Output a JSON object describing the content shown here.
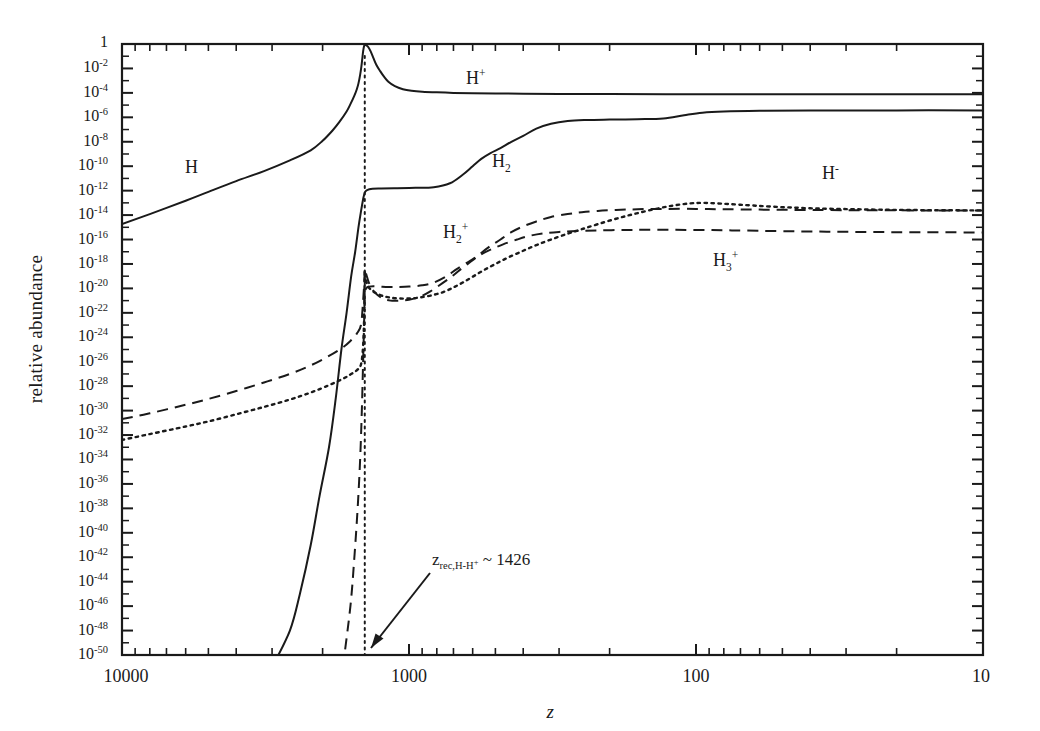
{
  "chart_data": {
    "type": "line",
    "title": "",
    "xlabel": "z",
    "ylabel": "relative abundance",
    "x_scale": "log",
    "y_scale": "log",
    "x_reversed": true,
    "xlim": [
      10000,
      10
    ],
    "ylim": [
      1e-50,
      1
    ],
    "grid": false,
    "legend": "inline-curve-labels",
    "x_tick_labels": [
      "10000",
      "1000",
      "100",
      "10"
    ],
    "x_tick_values": [
      10000,
      1000,
      100,
      10
    ],
    "y_tick_labels": [
      "1",
      "10-2",
      "10-4",
      "10-6",
      "10-8",
      "10-10",
      "10-12",
      "10-14",
      "10-16",
      "10-18",
      "10-20",
      "10-22",
      "10-24",
      "10-26",
      "10-28",
      "10-30",
      "10-32",
      "10-34",
      "10-36",
      "10-38",
      "10-40",
      "10-42",
      "10-44",
      "10-46",
      "10-48",
      "10-50"
    ],
    "y_tick_exponents": [
      0,
      -2,
      -4,
      -6,
      -8,
      -10,
      -12,
      -14,
      -16,
      -18,
      -20,
      -22,
      -24,
      -26,
      -28,
      -30,
      -32,
      -34,
      -36,
      -38,
      -40,
      -42,
      -44,
      -46,
      -48,
      -50
    ],
    "annotations": [
      {
        "name": "recombination-marker",
        "text_main": "z",
        "text_sub": "rec,H-H",
        "text_sup": "+",
        "text_tail": " ~ 1426",
        "z_value": 1426,
        "marker_style": "dotted-vertical-line",
        "arrow": "down-left"
      }
    ],
    "series": [
      {
        "name": "H",
        "label_main": "H",
        "label_sub": "",
        "label_sup": "",
        "style": "solid",
        "points": [
          [
            10000,
            1.8e-15
          ],
          [
            8000,
            1.2e-14
          ],
          [
            6000,
            1.5e-13
          ],
          [
            5000,
            8e-13
          ],
          [
            4000,
            6e-12
          ],
          [
            3200,
            4e-11
          ],
          [
            2600,
            3e-10
          ],
          [
            2200,
            2e-09
          ],
          [
            2000,
            1.2e-08
          ],
          [
            1850,
            8e-08
          ],
          [
            1750,
            4e-07
          ],
          [
            1650,
            3e-06
          ],
          [
            1600,
            1.2e-05
          ],
          [
            1550,
            6e-05
          ],
          [
            1520,
            0.0002
          ],
          [
            1500,
            0.0006
          ],
          [
            1480,
            0.003
          ],
          [
            1465,
            0.015
          ],
          [
            1455,
            0.06
          ],
          [
            1445,
            0.25
          ],
          [
            1435,
            0.62
          ],
          [
            1426,
            0.9
          ],
          [
            1420,
            0.92
          ],
          [
            1410,
            0.93
          ]
        ]
      },
      {
        "name": "H+",
        "label_main": "H",
        "label_sub": "",
        "label_sup": "+",
        "style": "solid",
        "points": [
          [
            1426,
            0.9
          ],
          [
            1390,
            0.6
          ],
          [
            1360,
            0.25
          ],
          [
            1330,
            0.07
          ],
          [
            1300,
            0.02
          ],
          [
            1260,
            0.006
          ],
          [
            1220,
            0.002
          ],
          [
            1180,
            0.0008
          ],
          [
            1120,
            0.00035
          ],
          [
            1050,
            0.0002
          ],
          [
            980,
            0.00015
          ],
          [
            900,
            0.000125
          ],
          [
            800,
            0.00011
          ],
          [
            700,
            0.0001
          ],
          [
            600,
            9.5e-05
          ],
          [
            500,
            9e-05
          ],
          [
            400,
            8.6e-05
          ],
          [
            300,
            8.2e-05
          ],
          [
            200,
            8e-05
          ],
          [
            100,
            7.8e-05
          ],
          [
            50,
            7.7e-05
          ],
          [
            20,
            7.6e-05
          ],
          [
            10,
            7.6e-05
          ]
        ]
      },
      {
        "name": "H2",
        "label_main": "H",
        "label_sub": "2",
        "label_sup": "",
        "style": "solid",
        "points": [
          [
            3000,
            1e-51
          ],
          [
            2600,
            1e-48
          ],
          [
            2400,
            1e-45
          ],
          [
            2200,
            1e-41
          ],
          [
            2050,
            1e-37
          ],
          [
            1900,
            1e-33
          ],
          [
            1800,
            1e-29
          ],
          [
            1720,
            1e-25
          ],
          [
            1650,
            1e-22
          ],
          [
            1590,
            1e-19
          ],
          [
            1540,
            1e-17
          ],
          [
            1500,
            1e-15
          ],
          [
            1470,
            2e-14
          ],
          [
            1445,
            2e-13
          ],
          [
            1426,
            7e-13
          ],
          [
            1400,
            1.1e-12
          ],
          [
            1340,
            1.4e-12
          ],
          [
            1250,
            1.5e-12
          ],
          [
            1100,
            1.6e-12
          ],
          [
            950,
            1.7e-12
          ],
          [
            820,
            1.9e-12
          ],
          [
            720,
            4e-12
          ],
          [
            650,
            2e-11
          ],
          [
            600,
            1e-10
          ],
          [
            560,
            4e-10
          ],
          [
            520,
            1.2e-09
          ],
          [
            480,
            3e-09
          ],
          [
            440,
            1e-08
          ],
          [
            400,
            3e-08
          ],
          [
            360,
            1.2e-07
          ],
          [
            320,
            3e-07
          ],
          [
            280,
            5e-07
          ],
          [
            240,
            6e-07
          ],
          [
            200,
            6.5e-07
          ],
          [
            160,
            7e-07
          ],
          [
            130,
            8e-07
          ],
          [
            110,
            1.5e-06
          ],
          [
            95,
            2.4e-06
          ],
          [
            80,
            3e-06
          ],
          [
            60,
            3.4e-06
          ],
          [
            40,
            3.6e-06
          ],
          [
            20,
            3.7e-06
          ],
          [
            10,
            3.7e-06
          ]
        ]
      },
      {
        "name": "H2+",
        "label_main": "H",
        "label_sub": "2",
        "label_sup": "+",
        "style": "dashed",
        "points": [
          [
            10000,
            2e-31
          ],
          [
            8000,
            6e-31
          ],
          [
            6000,
            3e-30
          ],
          [
            5000,
            9e-30
          ],
          [
            4000,
            4e-29
          ],
          [
            3200,
            2e-28
          ],
          [
            2600,
            1e-27
          ],
          [
            2200,
            5e-27
          ],
          [
            1900,
            3e-26
          ],
          [
            1700,
            1.5e-25
          ],
          [
            1600,
            5e-25
          ],
          [
            1520,
            2e-24
          ],
          [
            1470,
            1e-23
          ],
          [
            1445,
            1e-21
          ],
          [
            1430,
            5e-20
          ],
          [
            1426,
            4e-19
          ],
          [
            1410,
            1.5e-19
          ],
          [
            1380,
            3e-20
          ],
          [
            1340,
            8e-21
          ],
          [
            1290,
            3e-21
          ],
          [
            1230,
            1.4e-21
          ],
          [
            1160,
            1e-21
          ],
          [
            1080,
            1e-21
          ],
          [
            1000,
            1.2e-21
          ],
          [
            920,
            2e-21
          ],
          [
            840,
            6e-21
          ],
          [
            760,
            3e-20
          ],
          [
            700,
            1.2e-19
          ],
          [
            650,
            5e-19
          ],
          [
            600,
            2e-18
          ],
          [
            560,
            8e-18
          ],
          [
            520,
            3e-17
          ],
          [
            480,
            1e-16
          ],
          [
            440,
            4e-16
          ],
          [
            400,
            1.2e-15
          ],
          [
            360,
            3e-15
          ],
          [
            320,
            7e-15
          ],
          [
            280,
            1.2e-14
          ],
          [
            250,
            1.7e-14
          ],
          [
            220,
            2.2e-14
          ],
          [
            190,
            2.6e-14
          ],
          [
            160,
            3e-14
          ],
          [
            130,
            3.2e-14
          ],
          [
            100,
            3.2e-14
          ],
          [
            80,
            3e-14
          ],
          [
            60,
            2.8e-14
          ],
          [
            40,
            2.6e-14
          ],
          [
            25,
            2.5e-14
          ],
          [
            15,
            2.4e-14
          ],
          [
            10,
            2.4e-14
          ]
        ]
      },
      {
        "name": "H3+",
        "label_main": "H",
        "label_sub": "3",
        "label_sup": "+",
        "style": "dashed",
        "points": [
          [
            1700,
            1e-51
          ],
          [
            1600,
            1e-46
          ],
          [
            1550,
            1e-42
          ],
          [
            1510,
            1e-38
          ],
          [
            1480,
            1e-34
          ],
          [
            1460,
            1e-30
          ],
          [
            1445,
            1e-26
          ],
          [
            1434,
            1e-23
          ],
          [
            1426,
            3e-21
          ],
          [
            1410,
            1e-20
          ],
          [
            1380,
            1.4e-20
          ],
          [
            1330,
            1.5e-20
          ],
          [
            1260,
            1.4e-20
          ],
          [
            1180,
            1.3e-20
          ],
          [
            1100,
            1.3e-20
          ],
          [
            1000,
            1.4e-20
          ],
          [
            900,
            1.8e-20
          ],
          [
            820,
            3e-20
          ],
          [
            740,
            1e-19
          ],
          [
            680,
            4e-19
          ],
          [
            620,
            1.5e-18
          ],
          [
            570,
            5e-18
          ],
          [
            520,
            1.5e-17
          ],
          [
            470,
            4e-17
          ],
          [
            420,
            1e-16
          ],
          [
            380,
            2e-16
          ],
          [
            340,
            3.2e-16
          ],
          [
            300,
            4.2e-16
          ],
          [
            260,
            5e-16
          ],
          [
            220,
            5.6e-16
          ],
          [
            180,
            6e-16
          ],
          [
            150,
            6.2e-16
          ],
          [
            120,
            6.2e-16
          ],
          [
            95,
            6e-16
          ],
          [
            75,
            5.6e-16
          ],
          [
            55,
            5e-16
          ],
          [
            35,
            4.4e-16
          ],
          [
            20,
            4e-16
          ],
          [
            10,
            3.8e-16
          ]
        ]
      },
      {
        "name": "H-",
        "label_main": "H",
        "label_sub": "",
        "label_sup": "-",
        "style": "dotted",
        "points": [
          [
            10000,
            4e-33
          ],
          [
            8000,
            1.2e-32
          ],
          [
            6000,
            5e-32
          ],
          [
            5000,
            1.3e-31
          ],
          [
            4000,
            5e-31
          ],
          [
            3200,
            2e-30
          ],
          [
            2600,
            8e-30
          ],
          [
            2200,
            3e-29
          ],
          [
            1900,
            1.2e-28
          ],
          [
            1700,
            4e-28
          ],
          [
            1600,
            9e-28
          ],
          [
            1520,
            2e-27
          ],
          [
            1470,
            6e-27
          ],
          [
            1445,
            2e-25
          ],
          [
            1432,
            1e-22
          ],
          [
            1426,
            2e-19
          ],
          [
            1415,
            6e-20
          ],
          [
            1390,
            1.5e-20
          ],
          [
            1350,
            7e-21
          ],
          [
            1300,
            4e-21
          ],
          [
            1240,
            2.5e-21
          ],
          [
            1170,
            1.8e-21
          ],
          [
            1090,
            1.5e-21
          ],
          [
            1000,
            1.5e-21
          ],
          [
            920,
            1.8e-21
          ],
          [
            840,
            2.6e-21
          ],
          [
            760,
            5e-21
          ],
          [
            700,
            1.2e-20
          ],
          [
            650,
            3e-20
          ],
          [
            600,
            9e-20
          ],
          [
            550,
            3e-19
          ],
          [
            500,
            1e-18
          ],
          [
            450,
            3.5e-18
          ],
          [
            400,
            1.2e-17
          ],
          [
            360,
            3.5e-17
          ],
          [
            320,
            1e-16
          ],
          [
            280,
            3e-16
          ],
          [
            250,
            7e-16
          ],
          [
            220,
            1.8e-15
          ],
          [
            190,
            5e-15
          ],
          [
            165,
            1.2e-14
          ],
          [
            140,
            3e-14
          ],
          [
            120,
            6e-14
          ],
          [
            105,
            9e-14
          ],
          [
            95,
            1e-13
          ],
          [
            85,
            9e-14
          ],
          [
            70,
            7e-14
          ],
          [
            55,
            5e-14
          ],
          [
            40,
            3.6e-14
          ],
          [
            28,
            3e-14
          ],
          [
            18,
            2.6e-14
          ],
          [
            10,
            2.4e-14
          ]
        ]
      }
    ]
  },
  "axis": {
    "y_title": "relative abundance",
    "x_title": "z"
  },
  "colors": {
    "ink": "#1a1a1a",
    "background": "#ffffff"
  }
}
